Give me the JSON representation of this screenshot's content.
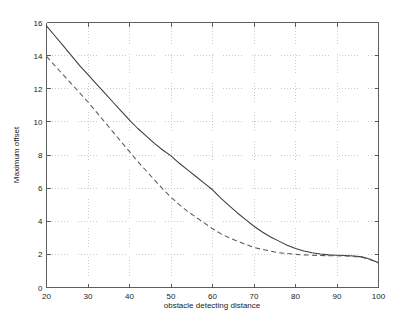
{
  "chart_data": {
    "type": "line",
    "title": "",
    "xlabel": "obstacle detecting distance",
    "ylabel": "Maximum offset",
    "xlim": [
      20,
      100
    ],
    "ylim": [
      0,
      16
    ],
    "xticks": [
      20,
      30,
      40,
      50,
      60,
      70,
      80,
      90,
      100
    ],
    "yticks": [
      0,
      2,
      4,
      6,
      8,
      10,
      12,
      14,
      16
    ],
    "xtick_labels": [
      "20",
      "30",
      "40",
      "50",
      "60",
      "70",
      "80",
      "90",
      "100"
    ],
    "ytick_labels": [
      "0",
      "2",
      "4",
      "6",
      "8",
      "10",
      "12",
      "14",
      "16"
    ],
    "grid": true,
    "grid_style": "dotted",
    "legend": null,
    "legend_position": "none",
    "series": [
      {
        "name": "solid-curve",
        "style": "solid",
        "color": "#3c3c3c",
        "x": [
          20,
          22,
          24,
          26,
          28,
          30,
          32,
          34,
          36,
          38,
          40,
          42,
          44,
          46,
          48,
          50,
          52,
          54,
          56,
          58,
          60,
          62,
          64,
          66,
          68,
          70,
          72,
          74,
          76,
          78,
          80,
          82,
          84,
          86,
          88,
          90,
          92,
          94,
          96,
          98,
          100
        ],
        "y": [
          15.8,
          15.2,
          14.6,
          14.0,
          13.4,
          12.85,
          12.3,
          11.75,
          11.2,
          10.65,
          10.1,
          9.6,
          9.15,
          8.7,
          8.3,
          7.95,
          7.5,
          7.1,
          6.7,
          6.3,
          5.9,
          5.4,
          4.95,
          4.5,
          4.1,
          3.7,
          3.35,
          3.05,
          2.8,
          2.55,
          2.35,
          2.2,
          2.1,
          2.02,
          1.97,
          1.95,
          1.93,
          1.9,
          1.85,
          1.7,
          1.5
        ]
      },
      {
        "name": "dashed-curve",
        "style": "dashed",
        "color": "#5a5a5a",
        "x": [
          20,
          22,
          24,
          26,
          28,
          30,
          32,
          34,
          36,
          38,
          40,
          42,
          44,
          46,
          48,
          50,
          52,
          54,
          56,
          58,
          60,
          62,
          64,
          66,
          68,
          70,
          72,
          74,
          76,
          78,
          80,
          82,
          84,
          86,
          88,
          90,
          92,
          94,
          96,
          98,
          100
        ],
        "y": [
          13.95,
          13.4,
          12.85,
          12.3,
          11.75,
          11.2,
          10.6,
          10.0,
          9.4,
          8.8,
          8.2,
          7.6,
          7.05,
          6.5,
          5.95,
          5.45,
          5.0,
          4.6,
          4.25,
          3.9,
          3.55,
          3.25,
          3.0,
          2.8,
          2.6,
          2.42,
          2.3,
          2.2,
          2.1,
          2.05,
          2.0,
          1.97,
          1.95,
          1.93,
          1.92,
          1.92,
          1.9,
          1.88,
          1.82,
          1.68,
          1.48
        ]
      }
    ]
  },
  "figure": {
    "background_color": "#ffffff",
    "axis_color": "#4d4d4d",
    "grid_color": "#b5b5b5"
  }
}
